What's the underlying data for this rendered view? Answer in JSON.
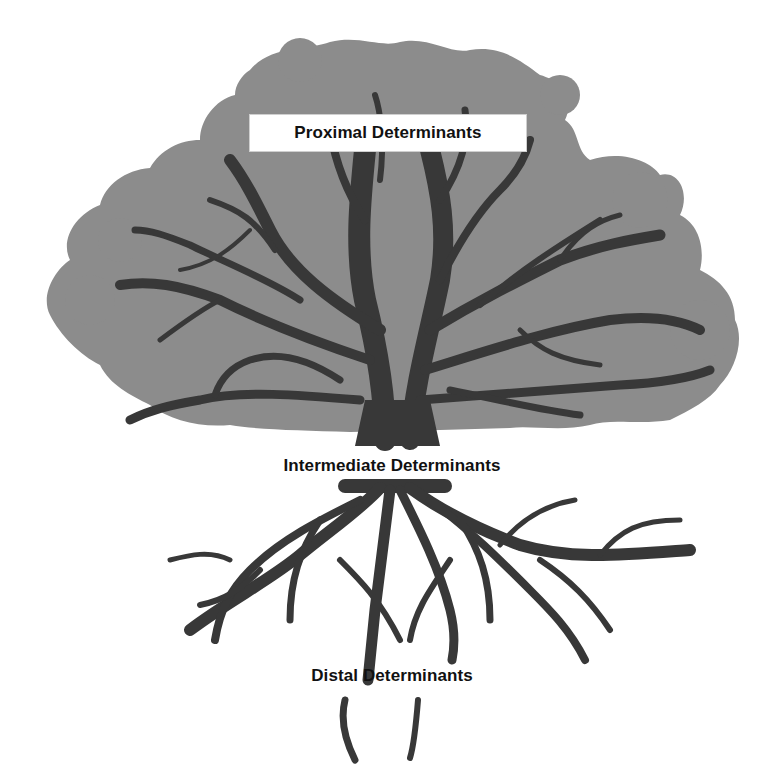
{
  "diagram": {
    "type": "tree-metaphor",
    "colors": {
      "canopy": "#8c8c8c",
      "trunk_and_roots": "#383838",
      "background": "#ffffff",
      "label_box": "#ffffff",
      "text": "#111111"
    },
    "labels": {
      "proximal": "Proximal Determinants",
      "intermediate": "Intermediate Determinants",
      "distal": "Distal Determinants"
    }
  }
}
